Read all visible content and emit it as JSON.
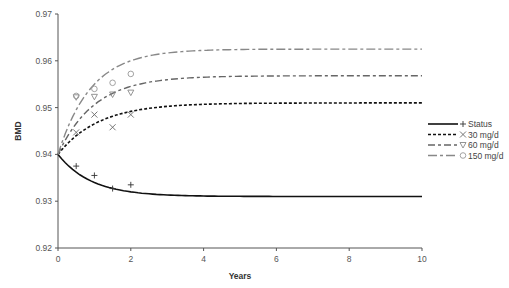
{
  "chart_data": {
    "type": "line",
    "title": "",
    "xlabel": "Years",
    "ylabel": "BMD",
    "xlim": [
      0,
      10
    ],
    "ylim": [
      0.92,
      0.97
    ],
    "xticks": [
      "0",
      "2",
      "4",
      "6",
      "8",
      "10"
    ],
    "yticks": [
      "0.92",
      "0.93",
      "0.94",
      "0.95",
      "0.96",
      "0.97"
    ],
    "grid": false,
    "legend_position": "right",
    "series": [
      {
        "name": "Status",
        "marker": "+",
        "color": "#111111",
        "style": "solid",
        "curve": {
          "start": 0.94,
          "end": 0.931,
          "rate": 1.1
        },
        "points": [
          {
            "x": 0.5,
            "y": 0.9375
          },
          {
            "x": 1.0,
            "y": 0.9355
          },
          {
            "x": 1.5,
            "y": 0.9327
          },
          {
            "x": 2.0,
            "y": 0.9335
          }
        ]
      },
      {
        "name": "30 mg/d",
        "marker": "x",
        "color": "#111111",
        "style": "dotted",
        "curve": {
          "start": 0.94,
          "end": 0.951,
          "rate": 0.9
        },
        "points": [
          {
            "x": 0.5,
            "y": 0.9447
          },
          {
            "x": 1.0,
            "y": 0.9485
          },
          {
            "x": 1.5,
            "y": 0.9458
          },
          {
            "x": 2.0,
            "y": 0.9485
          }
        ]
      },
      {
        "name": "60 mg/d",
        "marker": "triangle-down",
        "color": "#666666",
        "style": "dashdot",
        "curve": {
          "start": 0.94,
          "end": 0.9568,
          "rate": 1.0
        },
        "points": [
          {
            "x": 0.5,
            "y": 0.9522
          },
          {
            "x": 1.0,
            "y": 0.9523
          },
          {
            "x": 1.5,
            "y": 0.9528
          },
          {
            "x": 2.0,
            "y": 0.9532
          }
        ]
      },
      {
        "name": "150 mg/d",
        "marker": "circle",
        "color": "#888888",
        "style": "longdash",
        "curve": {
          "start": 0.94,
          "end": 0.9625,
          "rate": 1.1
        },
        "points": [
          {
            "x": 0.5,
            "y": 0.9525
          },
          {
            "x": 1.0,
            "y": 0.954
          },
          {
            "x": 1.5,
            "y": 0.9553
          },
          {
            "x": 2.0,
            "y": 0.9572
          }
        ]
      }
    ]
  }
}
